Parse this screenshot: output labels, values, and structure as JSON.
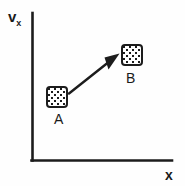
{
  "figure": {
    "type": "phase-space-diagram",
    "background_color": "#fefefe",
    "ink_color": "#1c1c1c",
    "axes": {
      "y_label_main": "v",
      "y_label_subscript": "x",
      "x_label": "x",
      "origin": {
        "x": 32,
        "y": 160
      },
      "y_axis_top": {
        "x": 32,
        "y": 13
      },
      "x_axis_right": {
        "x": 172,
        "y": 160
      },
      "ticks": "none",
      "grid": "off"
    },
    "states": [
      {
        "name": "A",
        "label": "A",
        "fill": "stippled",
        "box": {
          "x": 46,
          "y": 86,
          "width": 22,
          "height": 22
        },
        "label_position": {
          "x": 54,
          "y": 112
        }
      },
      {
        "name": "B",
        "label": "B",
        "fill": "stippled",
        "box": {
          "x": 121,
          "y": 44,
          "width": 22,
          "height": 22
        },
        "label_position": {
          "x": 126,
          "y": 71
        }
      }
    ],
    "arrow": {
      "from_state": "A",
      "to_state": "B",
      "start": {
        "x": 69,
        "y": 93
      },
      "end": {
        "x": 119,
        "y": 54
      },
      "head": "solid-triangle",
      "direction": "up-right"
    }
  }
}
